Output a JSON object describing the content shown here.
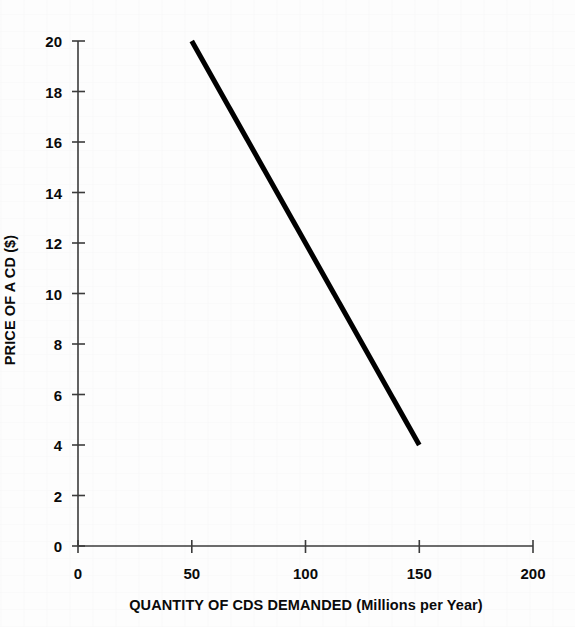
{
  "chart_data": {
    "type": "line",
    "title": "",
    "subtitle": "",
    "xlabel": "QUANTITY OF CDS DEMANDED (Millions per Year)",
    "ylabel": "PRICE OF A CD ($)",
    "xlim": [
      0,
      200
    ],
    "ylim": [
      0,
      20
    ],
    "xticks": [
      0,
      50,
      100,
      150,
      200
    ],
    "yticks": [
      0,
      2,
      4,
      6,
      8,
      10,
      12,
      14,
      16,
      18,
      20
    ],
    "xtick_labels": [
      "0",
      "50",
      "100",
      "150",
      "200"
    ],
    "ytick_labels": [
      "0",
      "2",
      "4",
      "6",
      "8",
      "10",
      "12",
      "14",
      "16",
      "18",
      "20"
    ],
    "grid": false,
    "legend": null,
    "legend_position": "none",
    "annotations": [],
    "series": [
      {
        "name": "Demand curve",
        "color": "#000000",
        "line_width_px": 5,
        "x": [
          50,
          150
        ],
        "y": [
          20,
          4
        ],
        "points": [
          {
            "x": 50,
            "y": 20
          },
          {
            "x": 150,
            "y": 4
          }
        ]
      }
    ]
  },
  "axes": {
    "y_axis_title": "PRICE OF A CD ($)",
    "x_axis_title": "QUANTITY OF CDS DEMANDED (Millions per Year)"
  },
  "colors": {
    "line": "#000000",
    "axis": "#3b3b3b",
    "text": "#0a0a0a",
    "background": "#fdfdfd"
  }
}
